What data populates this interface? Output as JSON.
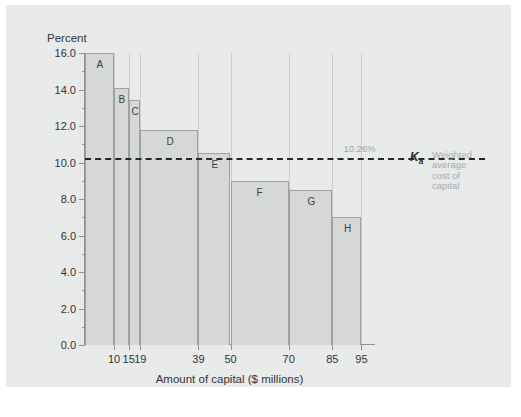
{
  "figure": {
    "panel_background": "#e9eaea",
    "bar_fill": "#d6d8d8",
    "bar_stroke": "#9ea2a3",
    "axis_color": "#8d9193",
    "wacc_line_color": "#23282a",
    "annotation_color": "#a7acad"
  },
  "annotation": {
    "wacc_value_label": "10.26%",
    "wacc_symbol": "K",
    "wacc_symbol_sub": "a",
    "wacc_caption": "Weighted\naverage\ncost of\ncapital"
  },
  "chart_data": {
    "type": "bar",
    "title": "",
    "xlabel": "Amount of capital ($ millions)",
    "ylabel": "Percent",
    "ylim": [
      0.0,
      16.0
    ],
    "ytick_step": 2.0,
    "yminor_step": 1.0,
    "xlim": [
      0,
      100
    ],
    "grid": false,
    "legend": "none",
    "ytick_labels": [
      "0.0",
      "2.0",
      "4.0",
      "6.0",
      "8.0",
      "10.0",
      "12.0",
      "14.0",
      "16.0"
    ],
    "ytick_values": [
      0.0,
      2.0,
      4.0,
      6.0,
      8.0,
      10.0,
      12.0,
      14.0,
      16.0
    ],
    "xtick_labels": [
      "10",
      "15",
      "19",
      "39",
      "50",
      "70",
      "85",
      "95"
    ],
    "xtick_values": [
      10,
      15,
      19,
      39,
      50,
      70,
      85,
      95
    ],
    "categories": [
      "A",
      "B",
      "C",
      "D",
      "E",
      "F",
      "G",
      "H"
    ],
    "values": [
      16.0,
      14.1,
      13.4,
      11.8,
      10.5,
      9.0,
      8.5,
      7.0
    ],
    "bars": [
      {
        "label": "A",
        "value": 16.0,
        "x_start": 0,
        "x_end": 10
      },
      {
        "label": "B",
        "value": 14.1,
        "x_start": 10,
        "x_end": 15
      },
      {
        "label": "C",
        "value": 13.4,
        "x_start": 15,
        "x_end": 19
      },
      {
        "label": "D",
        "value": 11.8,
        "x_start": 19,
        "x_end": 39
      },
      {
        "label": "E",
        "value": 10.5,
        "x_start": 39,
        "x_end": 50
      },
      {
        "label": "F",
        "value": 9.0,
        "x_start": 50,
        "x_end": 70
      },
      {
        "label": "G",
        "value": 8.5,
        "x_start": 70,
        "x_end": 85
      },
      {
        "label": "H",
        "value": 7.0,
        "x_start": 85,
        "x_end": 95
      }
    ],
    "reference_line": {
      "orientation": "horizontal",
      "value": 10.26,
      "style": "dashed",
      "label": "10.26%"
    }
  }
}
